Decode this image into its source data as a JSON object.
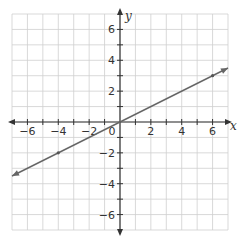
{
  "chart_data": {
    "type": "line",
    "title": "",
    "xlabel": "x",
    "ylabel": "y",
    "xlim": [
      -7,
      7
    ],
    "ylim": [
      -7,
      7
    ],
    "grid": true,
    "grid_step": 1,
    "x_ticks": [
      -6,
      -4,
      -2,
      0,
      2,
      4,
      6
    ],
    "y_ticks": [
      -6,
      -4,
      -2,
      2,
      4,
      6
    ],
    "x_tick_labels": [
      "−6",
      "−4",
      "−2",
      "0",
      "2",
      "4",
      "6"
    ],
    "y_tick_labels": [
      "−6",
      "−4",
      "−2",
      "2",
      "4",
      "6"
    ],
    "series": [
      {
        "name": "y = 0.5x",
        "x": [
          -7,
          7
        ],
        "y": [
          -3.5,
          3.5
        ],
        "arrows": "both",
        "marked_points": [
          {
            "x": -4,
            "y": -2
          },
          {
            "x": 6,
            "y": 3
          }
        ]
      }
    ],
    "legend": "none",
    "colors": {
      "grid": "#cfcfcf",
      "axis": "#333333",
      "line": "#666666"
    }
  }
}
